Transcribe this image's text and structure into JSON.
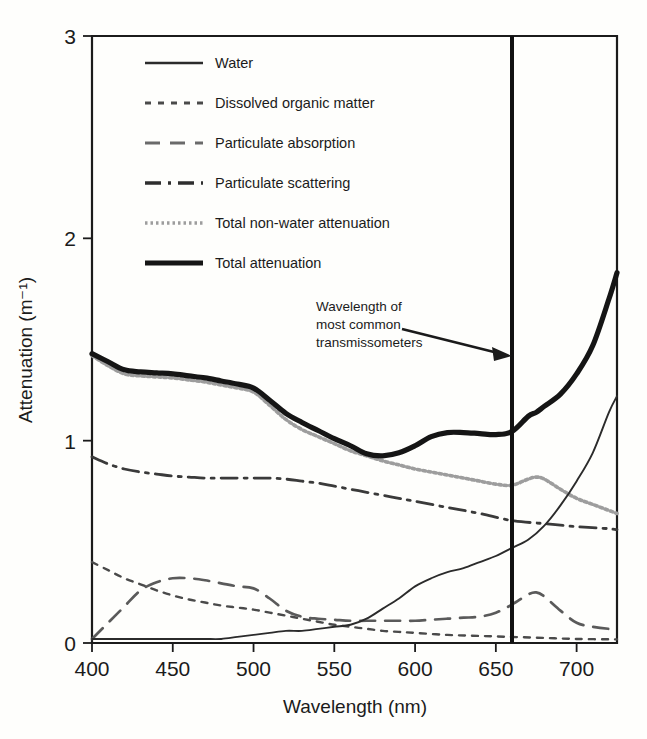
{
  "chart_data": {
    "type": "line",
    "title": "",
    "xlabel": "Wavelength (nm)",
    "ylabel": "Attenuation (m⁻¹)",
    "xlim": [
      400,
      725
    ],
    "ylim": [
      0,
      3
    ],
    "xticks": [
      400,
      450,
      500,
      550,
      600,
      650,
      700
    ],
    "yticks": [
      0,
      1,
      2,
      3
    ],
    "grid": false,
    "legend_position": "upper-left-inside",
    "annotations": [
      {
        "name": "transmissometer-annotation",
        "text_line1": "Wavelength of",
        "text_line2": "most common",
        "text_line3": "transmissometers",
        "arrow_to_x": 660,
        "marker_line_x": 660
      }
    ],
    "series": [
      {
        "name": "Water",
        "style": "solid",
        "color": "#2b2b2b",
        "width": 1.9,
        "x": [
          400,
          410,
          420,
          430,
          440,
          450,
          460,
          470,
          480,
          490,
          500,
          510,
          520,
          530,
          540,
          550,
          560,
          570,
          580,
          590,
          600,
          610,
          620,
          630,
          640,
          650,
          660,
          670,
          680,
          690,
          700,
          710,
          720,
          725
        ],
        "y": [
          0.02,
          0.02,
          0.02,
          0.02,
          0.02,
          0.02,
          0.02,
          0.02,
          0.02,
          0.03,
          0.04,
          0.05,
          0.06,
          0.06,
          0.07,
          0.08,
          0.09,
          0.12,
          0.17,
          0.22,
          0.28,
          0.32,
          0.35,
          0.37,
          0.4,
          0.43,
          0.47,
          0.51,
          0.58,
          0.68,
          0.8,
          0.94,
          1.14,
          1.22
        ]
      },
      {
        "name": "Dissolved organic matter",
        "style": "dotted-short",
        "color": "#4a4a4a",
        "width": 2.4,
        "x": [
          400,
          410,
          420,
          430,
          440,
          450,
          460,
          470,
          480,
          490,
          500,
          510,
          520,
          530,
          540,
          550,
          560,
          570,
          580,
          590,
          600,
          620,
          640,
          660,
          680,
          700,
          725
        ],
        "y": [
          0.4,
          0.36,
          0.32,
          0.29,
          0.26,
          0.235,
          0.215,
          0.2,
          0.185,
          0.175,
          0.165,
          0.15,
          0.135,
          0.12,
          0.105,
          0.09,
          0.08,
          0.07,
          0.06,
          0.055,
          0.05,
          0.04,
          0.035,
          0.03,
          0.025,
          0.02,
          0.018
        ]
      },
      {
        "name": "Particulate absorption",
        "style": "dashed-long",
        "color": "#5a5a5a",
        "width": 2.7,
        "x": [
          400,
          410,
          420,
          430,
          440,
          450,
          460,
          470,
          480,
          490,
          500,
          510,
          520,
          530,
          540,
          550,
          560,
          570,
          580,
          590,
          600,
          610,
          620,
          630,
          640,
          650,
          660,
          670,
          675,
          680,
          690,
          700,
          710,
          720,
          725
        ],
        "y": [
          0.02,
          0.1,
          0.18,
          0.26,
          0.3,
          0.32,
          0.32,
          0.31,
          0.295,
          0.28,
          0.27,
          0.22,
          0.16,
          0.13,
          0.12,
          0.115,
          0.11,
          0.11,
          0.11,
          0.11,
          0.11,
          0.115,
          0.12,
          0.125,
          0.13,
          0.15,
          0.19,
          0.24,
          0.25,
          0.23,
          0.16,
          0.1,
          0.08,
          0.07,
          0.07
        ]
      },
      {
        "name": "Particulate scattering",
        "style": "dash-dot",
        "color": "#3a3a3a",
        "width": 2.8,
        "x": [
          400,
          410,
          420,
          430,
          440,
          450,
          460,
          470,
          480,
          490,
          500,
          510,
          520,
          530,
          540,
          550,
          560,
          570,
          580,
          590,
          600,
          620,
          640,
          660,
          680,
          700,
          720,
          725
        ],
        "y": [
          0.92,
          0.885,
          0.86,
          0.845,
          0.835,
          0.825,
          0.82,
          0.815,
          0.815,
          0.815,
          0.815,
          0.815,
          0.81,
          0.8,
          0.79,
          0.775,
          0.76,
          0.745,
          0.73,
          0.715,
          0.7,
          0.67,
          0.64,
          0.605,
          0.59,
          0.575,
          0.565,
          0.56
        ]
      },
      {
        "name": "Total non-water attenuation",
        "style": "dotted-fine",
        "color": "#9d9d9d",
        "width": 3.6,
        "x": [
          400,
          410,
          420,
          430,
          440,
          450,
          460,
          470,
          480,
          490,
          500,
          510,
          520,
          530,
          540,
          550,
          560,
          570,
          580,
          590,
          600,
          610,
          620,
          630,
          640,
          650,
          660,
          670,
          675,
          680,
          690,
          700,
          710,
          720,
          725
        ],
        "y": [
          1.42,
          1.37,
          1.33,
          1.32,
          1.315,
          1.31,
          1.3,
          1.29,
          1.275,
          1.26,
          1.24,
          1.175,
          1.105,
          1.055,
          1.02,
          0.985,
          0.95,
          0.925,
          0.9,
          0.88,
          0.86,
          0.845,
          0.83,
          0.815,
          0.8,
          0.785,
          0.78,
          0.81,
          0.82,
          0.81,
          0.76,
          0.715,
          0.685,
          0.655,
          0.64
        ]
      },
      {
        "name": "Total attenuation",
        "style": "solid",
        "color": "#151515",
        "width": 5.2,
        "x": [
          400,
          410,
          420,
          430,
          440,
          450,
          460,
          470,
          480,
          490,
          500,
          510,
          520,
          530,
          540,
          550,
          560,
          570,
          580,
          590,
          600,
          610,
          620,
          630,
          640,
          650,
          660,
          670,
          675,
          680,
          690,
          700,
          710,
          720,
          725
        ],
        "y": [
          1.43,
          1.39,
          1.35,
          1.34,
          1.335,
          1.33,
          1.32,
          1.31,
          1.295,
          1.28,
          1.26,
          1.2,
          1.135,
          1.09,
          1.05,
          1.01,
          0.975,
          0.935,
          0.925,
          0.94,
          0.975,
          1.02,
          1.04,
          1.04,
          1.035,
          1.03,
          1.045,
          1.12,
          1.14,
          1.17,
          1.23,
          1.33,
          1.47,
          1.7,
          1.83
        ]
      }
    ]
  },
  "legend": {
    "items": [
      {
        "label": "Water",
        "style": "solid",
        "color": "#2b2b2b",
        "width": 2.6
      },
      {
        "label": "Dissolved organic matter",
        "style": "dotted-short",
        "color": "#4a4a4a",
        "width": 2.8
      },
      {
        "label": "Particulate absorption",
        "style": "dashed-long",
        "color": "#6a6a6a",
        "width": 2.8
      },
      {
        "label": "Particulate scattering",
        "style": "dash-dot",
        "color": "#2e2e2e",
        "width": 3.4
      },
      {
        "label": "Total non-water attenuation",
        "style": "dotted-fine",
        "color": "#9d9d9d",
        "width": 3.6
      },
      {
        "label": "Total attenuation",
        "style": "solid",
        "color": "#151515",
        "width": 5.0
      }
    ]
  },
  "axes": {
    "xlabel": "Wavelength (nm)",
    "ylabel": "Attenuation (m⁻¹)",
    "xticklabels": [
      "400",
      "450",
      "500",
      "550",
      "600",
      "650",
      "700"
    ],
    "yticklabels": [
      "0",
      "1",
      "2",
      "3"
    ]
  },
  "annotation": {
    "line1": "Wavelength of",
    "line2": "most common",
    "line3": "transmissometers"
  }
}
